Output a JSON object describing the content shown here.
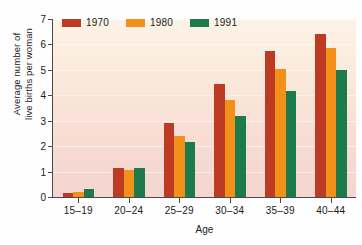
{
  "chart_data": {
    "type": "bar",
    "title": "",
    "xlabel": "Age",
    "ylabel": "Average number of\nlive births per woman",
    "categories": [
      "15–19",
      "20–24",
      "25–29",
      "30–34",
      "35–39",
      "40–44"
    ],
    "series": [
      {
        "name": "1970",
        "color": "#bd3b22",
        "values": [
          0.15,
          1.15,
          2.9,
          4.45,
          5.75,
          6.4
        ]
      },
      {
        "name": "1980",
        "color": "#f3901a",
        "values": [
          0.2,
          1.05,
          2.4,
          3.8,
          5.05,
          5.85
        ]
      },
      {
        "name": "1991",
        "color": "#1d7a4c",
        "values": [
          0.3,
          1.15,
          2.15,
          3.2,
          4.15,
          5.0
        ]
      }
    ],
    "ylim": [
      0,
      7
    ],
    "ytick_labels": [
      "0",
      "1",
      "2",
      "3",
      "4",
      "5",
      "6",
      "7"
    ],
    "ytick_values": [
      0,
      1,
      2,
      3,
      4,
      5,
      6,
      7
    ],
    "grid": true,
    "legend_position": "top-left-inside",
    "plot_background": "#fbe9dc"
  }
}
